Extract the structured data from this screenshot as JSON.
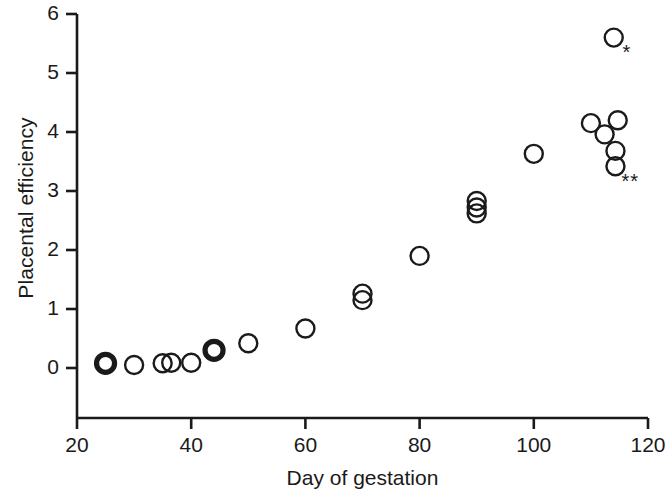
{
  "chart_data": {
    "type": "scatter",
    "title": "",
    "xlabel": "Day of gestation",
    "ylabel": "Placental efficiency",
    "xlim": [
      20,
      120
    ],
    "ylim": [
      0,
      6
    ],
    "xticks": [
      20,
      40,
      60,
      80,
      100,
      120
    ],
    "yticks": [
      0,
      1,
      2,
      3,
      4,
      5,
      6
    ],
    "xtick_labels": [
      "20",
      "40",
      "60",
      "80",
      "100",
      "120"
    ],
    "ytick_labels": [
      "0",
      "1",
      "2",
      "3",
      "4",
      "5",
      "6"
    ],
    "grid": false,
    "legend": null,
    "marker": "open-circle",
    "points": [
      {
        "x": 25,
        "y": 0.08,
        "bold": true
      },
      {
        "x": 30,
        "y": 0.05,
        "bold": false
      },
      {
        "x": 35,
        "y": 0.08,
        "bold": false
      },
      {
        "x": 36.5,
        "y": 0.09,
        "bold": false
      },
      {
        "x": 40,
        "y": 0.09,
        "bold": false
      },
      {
        "x": 44,
        "y": 0.3,
        "bold": true
      },
      {
        "x": 50,
        "y": 0.42,
        "bold": false
      },
      {
        "x": 60,
        "y": 0.67,
        "bold": false
      },
      {
        "x": 70,
        "y": 1.15,
        "bold": false
      },
      {
        "x": 70,
        "y": 1.26,
        "bold": false
      },
      {
        "x": 80,
        "y": 1.9,
        "bold": false
      },
      {
        "x": 90,
        "y": 2.62,
        "bold": false
      },
      {
        "x": 90,
        "y": 2.72,
        "bold": false
      },
      {
        "x": 90,
        "y": 2.83,
        "bold": false
      },
      {
        "x": 100,
        "y": 3.63,
        "bold": false
      },
      {
        "x": 114,
        "y": 5.6,
        "bold": false
      },
      {
        "x": 110,
        "y": 4.15,
        "bold": false
      },
      {
        "x": 114.7,
        "y": 4.2,
        "bold": false
      },
      {
        "x": 112.4,
        "y": 3.96,
        "bold": false
      },
      {
        "x": 114.3,
        "y": 3.68,
        "bold": false
      },
      {
        "x": 114.3,
        "y": 3.42,
        "bold": false
      }
    ],
    "annotations": [
      {
        "text": "*",
        "x": 116.6,
        "y": 5.33
      },
      {
        "text": "**",
        "x": 116.4,
        "y": 3.13
      }
    ]
  }
}
